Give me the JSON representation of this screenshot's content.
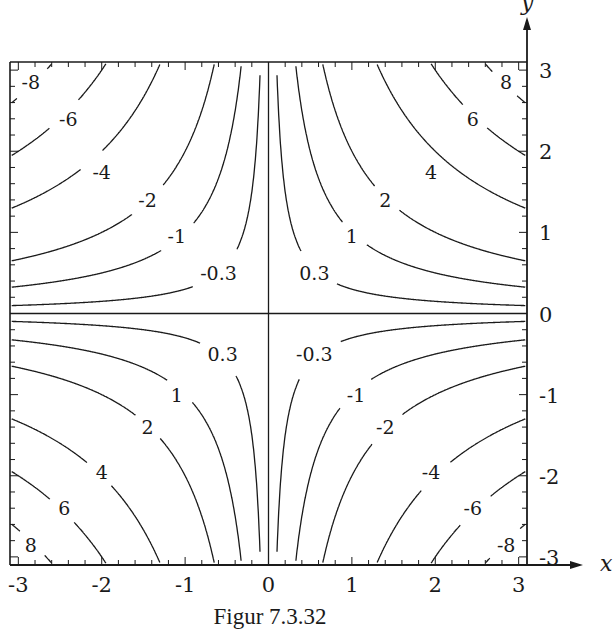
{
  "caption": "Figur 7.3.32",
  "chart_data": {
    "type": "contour",
    "title": "",
    "function": "f(x,y) = x*y",
    "xlabel": "x",
    "ylabel": "y",
    "xlim": [
      -3.1,
      3.1
    ],
    "ylim": [
      -3.1,
      3.1
    ],
    "x_ticks": [
      "-3",
      "-2",
      "-1",
      "0",
      "1",
      "2",
      "3"
    ],
    "y_ticks": [
      "3",
      "2",
      "1",
      "0",
      "-1",
      "-2",
      "-3"
    ],
    "x_tick_values": [
      -3,
      -2,
      -1,
      0,
      1,
      2,
      3
    ],
    "y_tick_values": [
      3,
      2,
      1,
      0,
      -1,
      -2,
      -3
    ],
    "minor_tick_step": 0.2,
    "grid": false,
    "levels": [
      -8,
      -6,
      -4,
      -2,
      -1,
      -0.3,
      0,
      0.3,
      1,
      2,
      4,
      6,
      8
    ],
    "labels": [
      {
        "text": "-8",
        "x": -2.85,
        "y": 2.85
      },
      {
        "text": "-6",
        "x": -2.4,
        "y": 2.4
      },
      {
        "text": "-4",
        "x": -2.0,
        "y": 1.75
      },
      {
        "text": "-2",
        "x": -1.45,
        "y": 1.4
      },
      {
        "text": "-1",
        "x": -1.1,
        "y": 0.95
      },
      {
        "text": "-0.3",
        "x": -0.6,
        "y": 0.5
      },
      {
        "text": "0.3",
        "x": 0.55,
        "y": 0.5
      },
      {
        "text": "1",
        "x": 1.0,
        "y": 0.95
      },
      {
        "text": "2",
        "x": 1.4,
        "y": 1.4
      },
      {
        "text": "4",
        "x": 1.95,
        "y": 1.75
      },
      {
        "text": "6",
        "x": 2.45,
        "y": 2.4
      },
      {
        "text": "8",
        "x": 2.85,
        "y": 2.85
      },
      {
        "text": "0.3",
        "x": -0.55,
        "y": -0.5
      },
      {
        "text": "-0.3",
        "x": 0.55,
        "y": -0.5
      },
      {
        "text": "1",
        "x": -1.1,
        "y": -1.0
      },
      {
        "text": "-1",
        "x": 1.05,
        "y": -1.0
      },
      {
        "text": "2",
        "x": -1.45,
        "y": -1.4
      },
      {
        "text": "-2",
        "x": 1.4,
        "y": -1.4
      },
      {
        "text": "4",
        "x": -2.0,
        "y": -1.95
      },
      {
        "text": "-4",
        "x": 1.95,
        "y": -1.95
      },
      {
        "text": "6",
        "x": -2.45,
        "y": -2.4
      },
      {
        "text": "-6",
        "x": 2.45,
        "y": -2.4
      },
      {
        "text": "8",
        "x": -2.85,
        "y": -2.85
      },
      {
        "text": "-8",
        "x": 2.85,
        "y": -2.85
      }
    ],
    "axes_position": {
      "y_axis": "right edge (x=3.1)",
      "x_axis": "bottom edge (y=-3.1)"
    }
  }
}
